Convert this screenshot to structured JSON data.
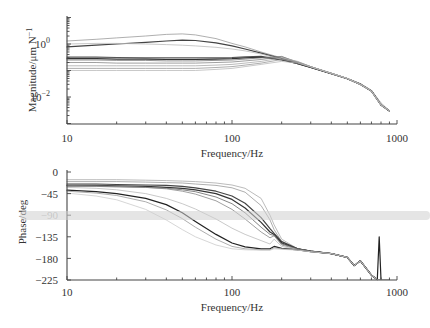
{
  "chart_data": [
    {
      "type": "line",
      "title": "",
      "xlabel": "Frequency/Hz",
      "ylabel": "Magnitude/μm N⁻¹",
      "xscale": "log",
      "yscale": "log",
      "xlim": [
        10,
        1000
      ],
      "ylim": [
        0.00095,
        11.5
      ],
      "x_tick_labels": [
        "10",
        "100",
        "1000"
      ],
      "y_tick_labels": [
        {
          "base": "10",
          "exp": "0",
          "value": 1
        },
        {
          "base": "10",
          "exp": "−2",
          "value": 0.01
        }
      ],
      "grid": false,
      "legend": null,
      "x": [
        10,
        15,
        20,
        30,
        40,
        50,
        60,
        80,
        100,
        120,
        150,
        200,
        250,
        300,
        400,
        500,
        600,
        700,
        800,
        900
      ],
      "series": [
        {
          "name": "curve-1",
          "color": "#9a9a9a",
          "values": [
            1.3,
            1.5,
            1.7,
            2.0,
            2.3,
            2.4,
            2.2,
            1.6,
            1.05,
            0.78,
            0.5,
            0.3,
            0.2,
            0.14,
            0.08,
            0.05,
            0.032,
            0.018,
            0.006,
            0.003
          ]
        },
        {
          "name": "curve-2",
          "color": "#444444",
          "values": [
            0.78,
            0.9,
            1.0,
            1.15,
            1.3,
            1.4,
            1.35,
            1.1,
            0.85,
            0.65,
            0.45,
            0.28,
            0.19,
            0.135,
            0.078,
            0.05,
            0.031,
            0.017,
            0.005,
            0.003
          ]
        },
        {
          "name": "curve-3",
          "color": "#bbbbbb",
          "values": [
            1.0,
            1.05,
            1.05,
            1.0,
            0.95,
            0.9,
            0.85,
            0.75,
            0.65,
            0.55,
            0.42,
            0.27,
            0.19,
            0.13,
            0.078,
            0.05,
            0.031,
            0.017,
            0.005,
            0.003
          ]
        },
        {
          "name": "curve-4",
          "color": "#555555",
          "values": [
            0.32,
            0.32,
            0.31,
            0.3,
            0.3,
            0.3,
            0.3,
            0.3,
            0.31,
            0.33,
            0.34,
            0.26,
            0.18,
            0.13,
            0.076,
            0.049,
            0.03,
            0.017,
            0.005,
            0.003
          ]
        },
        {
          "name": "curve-5",
          "color": "#333333",
          "values": [
            0.28,
            0.28,
            0.27,
            0.27,
            0.26,
            0.26,
            0.26,
            0.27,
            0.28,
            0.3,
            0.32,
            0.25,
            0.18,
            0.13,
            0.075,
            0.049,
            0.03,
            0.017,
            0.005,
            0.003
          ]
        },
        {
          "name": "curve-6",
          "color": "#777777",
          "values": [
            0.25,
            0.25,
            0.24,
            0.24,
            0.23,
            0.23,
            0.23,
            0.24,
            0.25,
            0.27,
            0.3,
            0.34,
            0.2,
            0.135,
            0.077,
            0.05,
            0.03,
            0.017,
            0.005,
            0.003
          ]
        },
        {
          "name": "curve-7",
          "color": "#888888",
          "values": [
            0.2,
            0.2,
            0.19,
            0.19,
            0.19,
            0.19,
            0.19,
            0.2,
            0.21,
            0.23,
            0.26,
            0.33,
            0.21,
            0.14,
            0.078,
            0.05,
            0.03,
            0.017,
            0.005,
            0.003
          ]
        },
        {
          "name": "curve-8",
          "color": "#aaaaaa",
          "values": [
            0.15,
            0.15,
            0.15,
            0.15,
            0.15,
            0.15,
            0.15,
            0.16,
            0.17,
            0.19,
            0.22,
            0.3,
            0.22,
            0.14,
            0.078,
            0.05,
            0.03,
            0.017,
            0.005,
            0.003
          ]
        },
        {
          "name": "curve-9",
          "color": "#999999",
          "values": [
            0.12,
            0.12,
            0.12,
            0.12,
            0.12,
            0.12,
            0.12,
            0.13,
            0.14,
            0.16,
            0.19,
            0.26,
            0.21,
            0.14,
            0.078,
            0.05,
            0.03,
            0.017,
            0.005,
            0.003
          ]
        },
        {
          "name": "curve-10",
          "color": "#bbbbbb",
          "values": [
            0.1,
            0.1,
            0.1,
            0.1,
            0.1,
            0.1,
            0.1,
            0.11,
            0.12,
            0.14,
            0.17,
            0.22,
            0.19,
            0.135,
            0.078,
            0.05,
            0.03,
            0.017,
            0.005,
            0.003
          ]
        }
      ]
    },
    {
      "type": "line",
      "title": "",
      "xlabel": "Frequency/Hz",
      "ylabel": "Phase/deg",
      "xscale": "log",
      "yscale": "linear",
      "xlim": [
        10,
        1000
      ],
      "ylim": [
        -225,
        0
      ],
      "x_tick_labels": [
        "10",
        "100",
        "1000"
      ],
      "y_tick_labels": [
        "0",
        "−45",
        "−90",
        "−135",
        "−180",
        "−225"
      ],
      "y_tick_values": [
        0,
        -45,
        -90,
        -135,
        -180,
        -225
      ],
      "grid": false,
      "legend": null,
      "x": [
        10,
        15,
        20,
        30,
        40,
        50,
        60,
        80,
        100,
        120,
        150,
        170,
        180,
        200,
        250,
        300,
        400,
        500,
        550,
        600,
        700,
        760,
        780,
        800,
        900
      ],
      "series": [
        {
          "name": "phase-1",
          "color": "#aaaaaa",
          "values": [
            -16,
            -16,
            -16,
            -17,
            -18,
            -19,
            -20,
            -23,
            -27,
            -34,
            -55,
            -90,
            -110,
            -140,
            -160,
            -165,
            -170,
            -178,
            -195,
            -185,
            -215,
            -225,
            -225,
            -225,
            -225
          ]
        },
        {
          "name": "phase-2",
          "color": "#999999",
          "values": [
            -20,
            -20,
            -20,
            -21,
            -22,
            -23,
            -25,
            -28,
            -33,
            -42,
            -70,
            -100,
            -120,
            -145,
            -160,
            -165,
            -170,
            -178,
            -195,
            -185,
            -215,
            -225,
            -225,
            -225,
            -225
          ]
        },
        {
          "name": "phase-3",
          "color": "#444444",
          "values": [
            -25,
            -25,
            -26,
            -27,
            -28,
            -30,
            -33,
            -40,
            -50,
            -65,
            -95,
            -118,
            -128,
            -145,
            -160,
            -165,
            -170,
            -178,
            -195,
            -185,
            -215,
            -225,
            -225,
            -225,
            -225
          ]
        },
        {
          "name": "phase-4",
          "color": "#333333",
          "values": [
            -28,
            -28,
            -29,
            -30,
            -32,
            -34,
            -37,
            -45,
            -57,
            -75,
            -105,
            -125,
            -130,
            -148,
            -160,
            -165,
            -170,
            -178,
            -195,
            -185,
            -215,
            -225,
            -225,
            -225,
            -225
          ]
        },
        {
          "name": "phase-5",
          "color": "#666666",
          "values": [
            -30,
            -30,
            -31,
            -32,
            -34,
            -37,
            -41,
            -52,
            -66,
            -85,
            -115,
            -130,
            -132,
            -150,
            -160,
            -165,
            -170,
            -178,
            -195,
            -185,
            -215,
            -225,
            -225,
            -225,
            -225
          ]
        },
        {
          "name": "phase-6",
          "color": "#888888",
          "values": [
            -28,
            -29,
            -30,
            -32,
            -35,
            -40,
            -46,
            -60,
            -78,
            -98,
            -125,
            -137,
            -133,
            -152,
            -161,
            -165,
            -170,
            -178,
            -195,
            -185,
            -215,
            -225,
            -225,
            -225,
            -225
          ]
        },
        {
          "name": "phase-7",
          "color": "#bbbbbb",
          "values": [
            -32,
            -34,
            -37,
            -45,
            -55,
            -66,
            -77,
            -98,
            -117,
            -130,
            -143,
            -150,
            -140,
            -155,
            -162,
            -166,
            -170,
            -178,
            -195,
            -185,
            -215,
            -225,
            -225,
            -225,
            -225
          ]
        },
        {
          "name": "phase-8",
          "color": "#222222",
          "values": [
            -38,
            -41,
            -45,
            -55,
            -68,
            -85,
            -103,
            -130,
            -148,
            -156,
            -160,
            -160,
            -155,
            -159,
            -162,
            -166,
            -170,
            -178,
            -195,
            -185,
            -215,
            -225,
            -135,
            -225,
            -225
          ]
        },
        {
          "name": "phase-9",
          "color": "#999999",
          "values": [
            -40,
            -44,
            -49,
            -62,
            -79,
            -97,
            -115,
            -140,
            -155,
            -160,
            -162,
            -162,
            -158,
            -160,
            -162,
            -166,
            -170,
            -178,
            -195,
            -185,
            -215,
            -225,
            -225,
            -225,
            -225
          ]
        },
        {
          "name": "phase-10",
          "color": "#cccccc",
          "values": [
            -44,
            -50,
            -58,
            -78,
            -100,
            -120,
            -135,
            -152,
            -160,
            -162,
            -163,
            -163,
            -160,
            -161,
            -163,
            -166,
            -170,
            -178,
            -195,
            -185,
            -215,
            -225,
            -225,
            -225,
            -225
          ]
        }
      ]
    }
  ],
  "figure": {
    "top_panel": {
      "ylabel": "Magnitude/μm N",
      "ylabel_superscript": "−1",
      "xlabel": "Frequency/Hz",
      "x_ticks": [
        "10",
        "100",
        "1000"
      ],
      "y_tick_base": "10",
      "y_tick_exps": [
        "0",
        "−2"
      ]
    },
    "bottom_panel": {
      "ylabel": "Phase/deg",
      "xlabel": "Frequency/Hz",
      "x_ticks": [
        "10",
        "100",
        "1000"
      ],
      "y_ticks": [
        "0",
        "−45",
        "−90",
        "−135",
        "−180",
        "−225"
      ]
    }
  }
}
